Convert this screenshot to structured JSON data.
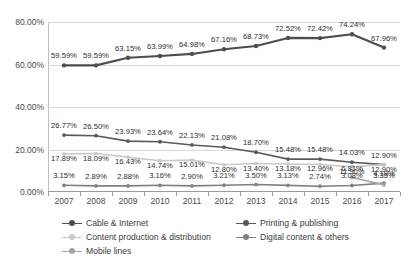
{
  "chart_data": {
    "type": "line",
    "title": "",
    "xlabel": "",
    "ylabel": "",
    "categories": [
      "2007",
      "2008",
      "2009",
      "2010",
      "2011",
      "2012",
      "2013",
      "2014",
      "2015",
      "2016",
      "2017"
    ],
    "ylim": [
      0,
      80
    ],
    "yticks": [
      0,
      20,
      40,
      60,
      80
    ],
    "ytick_labels": [
      "0.00%",
      "20.00%",
      "40.00%",
      "60.00%",
      "80.00%"
    ],
    "grid": true,
    "legend_position": "bottom",
    "series": [
      {
        "name": "Cable & Internet",
        "color": "#4d4d4d",
        "values": [
          59.59,
          59.59,
          63.15,
          63.99,
          64.98,
          67.16,
          68.73,
          72.52,
          72.42,
          74.24,
          67.96
        ],
        "labels": [
          "59.59%",
          "59.59%",
          "63.15%",
          "63.99%",
          "64.98%",
          "67.16%",
          "68.73%",
          "72.52%",
          "72.42%",
          "74.24%",
          "67.96%"
        ]
      },
      {
        "name": "Printing & publishing",
        "color": "#595959",
        "values": [
          26.77,
          26.5,
          23.93,
          23.64,
          22.13,
          21.08,
          18.7,
          15.48,
          15.48,
          14.03,
          12.9
        ],
        "labels": [
          "26.77%",
          "26.50%",
          "23.93%",
          "23.64%",
          "22.13%",
          "21.08%",
          "18.70%",
          "15.48%",
          "15.48%",
          "14.03%",
          "12.90%"
        ]
      },
      {
        "name": "Content production & distribution",
        "color": "#c9c9c9",
        "values": [
          17.89,
          18.09,
          16.43,
          14.74,
          15.01,
          12.8,
          13.4,
          13.18,
          12.96,
          11.9,
          12.9
        ],
        "labels": [
          "17.89%",
          "18.09%",
          "16.43%",
          "14.74%",
          "15.01%",
          "12.80%",
          "13.40%",
          "13.18%",
          "12.96%",
          "11.90%",
          "12.90%"
        ]
      },
      {
        "name": "Digital content & others",
        "color": "#808080",
        "values": [
          3.15,
          2.89,
          2.88,
          3.16,
          2.9,
          3.21,
          3.5,
          3.13,
          2.74,
          3.08,
          4.19
        ],
        "labels": [
          "3.15%",
          "2.89%",
          "2.88%",
          "3.16%",
          "2.90%",
          "3.21%",
          "3.50%",
          "3.13%",
          "2.74%",
          "3.08%",
          "4.19%"
        ]
      },
      {
        "name": "Mobile lines",
        "color": "#a6a6a6",
        "values": [
          null,
          null,
          null,
          null,
          null,
          null,
          null,
          null,
          null,
          6.81,
          3.35
        ],
        "labels": [
          "",
          "",
          "",
          "",
          "",
          "",
          "",
          "",
          "",
          "6.81%",
          "3.35%"
        ]
      }
    ]
  },
  "legend": {
    "items": [
      {
        "label": "Cable & Internet"
      },
      {
        "label": "Printing & publishing"
      },
      {
        "label": "Content production & distribution"
      },
      {
        "label": "Digital content & others"
      },
      {
        "label": "Mobile lines"
      }
    ]
  }
}
